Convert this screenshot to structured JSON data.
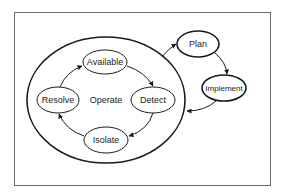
{
  "diagram": {
    "title": "",
    "frame": {
      "x": 14,
      "y": 12,
      "width": 256,
      "height": 173,
      "stroke": "#6b6b6b"
    },
    "outer_cycle": {
      "label": "Operate",
      "ellipse": {
        "cx": 106,
        "cy": 100,
        "rx": 79,
        "ry": 63
      }
    },
    "nodes": [
      {
        "id": "available",
        "label": "Available",
        "cx": 105,
        "cy": 62,
        "rx": 22,
        "ry": 12,
        "thick": false
      },
      {
        "id": "detect",
        "label": "Detect",
        "cx": 153,
        "cy": 100,
        "rx": 22,
        "ry": 13,
        "thick": false
      },
      {
        "id": "isolate",
        "label": "Isolate",
        "cx": 106,
        "cy": 140,
        "rx": 22,
        "ry": 13,
        "thick": false
      },
      {
        "id": "resolve",
        "label": "Resolve",
        "cx": 58,
        "cy": 100,
        "rx": 21,
        "ry": 13,
        "thick": false
      },
      {
        "id": "plan",
        "label": "Plan",
        "cx": 198,
        "cy": 44,
        "rx": 21,
        "ry": 13,
        "thick": true
      },
      {
        "id": "implement",
        "label": "Implement",
        "cx": 224,
        "cy": 88,
        "rx": 22,
        "ry": 13,
        "thick": true
      }
    ],
    "edges": [
      {
        "from": "available",
        "to": "detect"
      },
      {
        "from": "detect",
        "to": "isolate"
      },
      {
        "from": "isolate",
        "to": "resolve"
      },
      {
        "from": "resolve",
        "to": "available"
      },
      {
        "from": "operate",
        "to": "plan"
      },
      {
        "from": "plan",
        "to": "implement"
      },
      {
        "from": "implement",
        "to": "operate"
      }
    ]
  }
}
